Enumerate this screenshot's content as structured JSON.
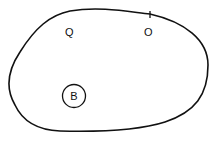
{
  "diagram": {
    "region": {
      "shape": "closed-blob",
      "stroke": "#111111"
    },
    "labels": [
      {
        "id": "Q",
        "text": "Q",
        "circled": false
      },
      {
        "id": "O",
        "text": "O",
        "circled": false,
        "boundary_tick": true
      },
      {
        "id": "B",
        "text": "B",
        "circled": true
      }
    ]
  }
}
